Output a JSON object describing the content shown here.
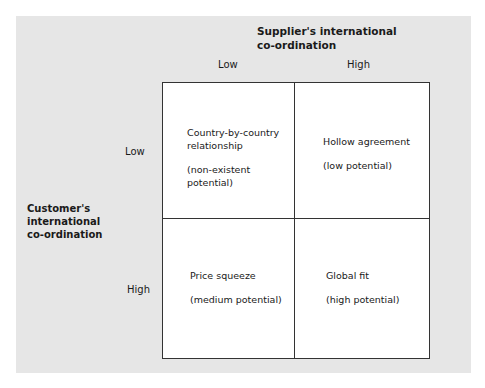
{
  "diagram": {
    "type": "2x2-matrix",
    "x_axis": {
      "title": "Supplier's international co-ordination",
      "title_lines": [
        "Supplier's international",
        "co-ordination"
      ],
      "levels": [
        "Low",
        "High"
      ]
    },
    "y_axis": {
      "title": "Customer's international co-ordination",
      "title_lines": [
        "Customer's",
        "international",
        "co-ordination"
      ],
      "levels": [
        "Low",
        "High"
      ]
    },
    "cells": [
      {
        "position": "low-low",
        "title_lines": [
          "Country-by-country",
          "relationship"
        ],
        "note_lines": [
          "(non-existent",
          "potential)"
        ]
      },
      {
        "position": "low-high",
        "title_lines": [
          "Hollow agreement"
        ],
        "note_lines": [
          "(low potential)"
        ]
      },
      {
        "position": "high-low",
        "title_lines": [
          "Price squeeze"
        ],
        "note_lines": [
          "(medium potential)"
        ]
      },
      {
        "position": "high-high",
        "title_lines": [
          "Global fit"
        ],
        "note_lines": [
          "(high potential)"
        ]
      }
    ]
  }
}
